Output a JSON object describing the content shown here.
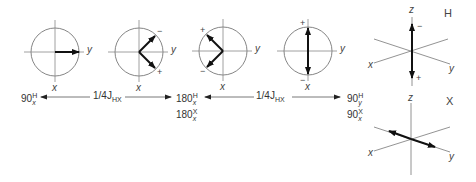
{
  "colors": {
    "circle": "#777777",
    "axis": "#888888",
    "vector": "#111111",
    "text": "#333333"
  },
  "circles": [
    {
      "id": "c1",
      "axis_x_label": "x",
      "axis_y_label": "y",
      "vector": "along +y",
      "signs": []
    },
    {
      "id": "c2",
      "axis_x_label": "x",
      "axis_y_label": "y",
      "vector": "split ±45°",
      "signs": [
        "−",
        "+"
      ]
    },
    {
      "id": "c3",
      "axis_x_label": "x",
      "axis_y_label": "y",
      "vector": "split ±45° mirrored",
      "signs": [
        "+",
        "−"
      ]
    },
    {
      "id": "c4",
      "axis_x_label": "x",
      "axis_y_label": "y",
      "vector": "antiphase along x",
      "signs": [
        "+",
        "−"
      ]
    }
  ],
  "pulses": [
    {
      "id": "p1",
      "angle": "90",
      "sup": "H",
      "sub": "x"
    },
    {
      "id": "p2a",
      "angle": "180",
      "sup": "H",
      "sub": "x"
    },
    {
      "id": "p2b",
      "angle": "180",
      "sup": "X",
      "sub": "x"
    },
    {
      "id": "p3a",
      "angle": "90",
      "sup": "H",
      "sub": "y"
    },
    {
      "id": "p3b",
      "angle": "90",
      "sup": "X",
      "sub": "x"
    }
  ],
  "delays": [
    {
      "id": "d1",
      "fraction": "1/4",
      "symbol": "J",
      "sub": "HX"
    },
    {
      "id": "d2",
      "fraction": "1/4",
      "symbol": "J",
      "sub": "HX"
    }
  ],
  "frames_3d": [
    {
      "id": "H",
      "label": "H",
      "z": "z",
      "x": "x",
      "y": "y",
      "signs": [
        "−",
        "+"
      ]
    },
    {
      "id": "X",
      "label": "X",
      "z": "z",
      "x": "x",
      "y": "y"
    }
  ]
}
